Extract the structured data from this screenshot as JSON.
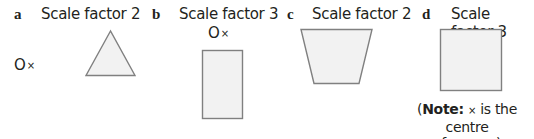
{
  "questions": [
    {
      "label": "a",
      "title": "Scale factor 2",
      "shape": "triangle",
      "centre_marker": "O×"
    },
    {
      "label": "b",
      "title": "Scale factor 3",
      "shape": "rectangle",
      "centre_marker": "O×"
    },
    {
      "label": "c",
      "title": "Scale factor 2",
      "shape": "trapezoid"
    },
    {
      "label": "d",
      "title": "Scale factor 3",
      "shape": "square",
      "centre_marker": "O×"
    }
  ],
  "note": {
    "open": "(",
    "bold": "Note:",
    "cross": "×",
    "rest_line1": " is the centre",
    "line2": "of square)"
  },
  "colors": {
    "shape_fill": "#f2f2f2",
    "shape_stroke": "#808080",
    "text": "#231f20"
  }
}
